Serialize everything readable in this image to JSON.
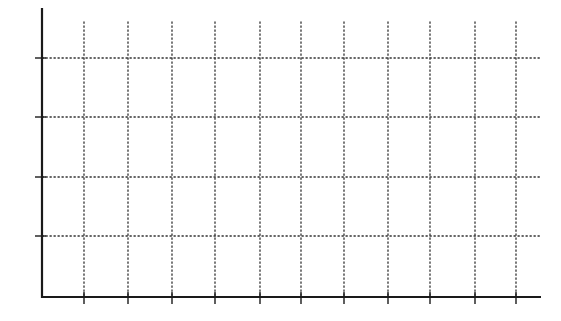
{
  "chart_data": {
    "type": "line",
    "title": "",
    "xlabel": "",
    "ylabel": "",
    "categories": [],
    "series": [],
    "x_ticks": [
      "",
      "",
      "",
      "",
      "",
      "",
      "",
      "",
      "",
      "",
      ""
    ],
    "y_ticks": [
      "",
      "",
      "",
      ""
    ],
    "grid": true,
    "grid_style": "dotted",
    "legend": null,
    "note": "Blank grid template with unlabeled axes; no data plotted"
  },
  "layout": {
    "axis_color": "#1a1a1a",
    "grid_color": "#333333",
    "background": "#ffffff",
    "y_axis_x": 42,
    "y_axis_top": 8,
    "x_axis_y": 297,
    "x_axis_right": 541,
    "grid_top": 22,
    "grid_right": 540,
    "vertical_gridlines_x": [
      84,
      128,
      172,
      215,
      260,
      301,
      344,
      388,
      430,
      475,
      516
    ],
    "horizontal_gridlines_y": [
      58,
      117,
      177,
      236
    ]
  }
}
